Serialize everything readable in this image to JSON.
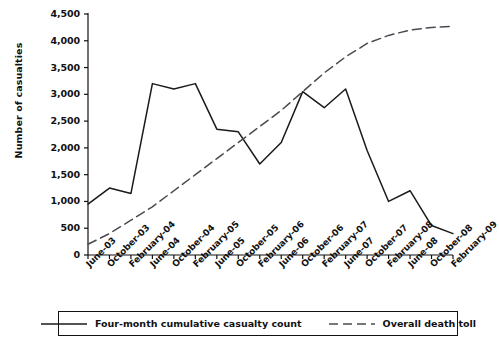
{
  "chart_data": {
    "type": "line",
    "title": "",
    "subtitle": "",
    "xlabel": "",
    "ylabel": "Number of casualties",
    "grid": false,
    "legend_position": "bottom",
    "ylim": [
      0,
      4500
    ],
    "ytick_step": 500,
    "yticks": [
      "0",
      "500",
      "1,000",
      "1,500",
      "2,000",
      "2,500",
      "3,000",
      "3,500",
      "4,000",
      "4,500"
    ],
    "ytick_values": [
      0,
      500,
      1000,
      1500,
      2000,
      2500,
      3000,
      3500,
      4000,
      4500
    ],
    "categories": [
      "June-03",
      "October-03",
      "February-04",
      "June-04",
      "October-04",
      "February-05",
      "June-05",
      "October-05",
      "February-06",
      "June-06",
      "October-06",
      "February-07",
      "June-07",
      "October-07",
      "February-08",
      "June-08",
      "October-08",
      "February-09"
    ],
    "series": [
      {
        "name": "Four-month cumulative casualty count",
        "style": "solid",
        "color": "#1a1a1a",
        "values": [
          950,
          1250,
          1150,
          3200,
          3100,
          3200,
          2350,
          2300,
          1700,
          2100,
          3050,
          2750,
          3100,
          1950,
          1000,
          1200,
          550,
          400
        ]
      },
      {
        "name": "Overall death toll",
        "style": "dashed",
        "color": "#4a4a52",
        "values": [
          200,
          400,
          650,
          900,
          1200,
          1500,
          1800,
          2100,
          2400,
          2700,
          3050,
          3400,
          3700,
          3950,
          4100,
          4200,
          4250,
          4270
        ]
      }
    ]
  },
  "legend": {
    "items": [
      {
        "label": "Four-month cumulative casualty count",
        "style": "solid"
      },
      {
        "label": "Overall death toll",
        "style": "dashed"
      }
    ]
  }
}
